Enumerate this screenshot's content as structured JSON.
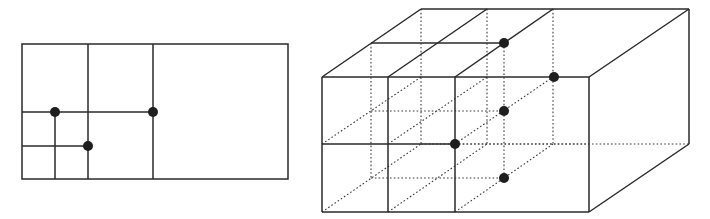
{
  "figure": {
    "colors": {
      "line": "#2a2a2a",
      "dot": "#1e1e1e",
      "background": "#ffffff"
    }
  },
  "quadtree_2d": {
    "frame": {
      "x1": 22,
      "y1": 44,
      "x2": 288,
      "y2": 179
    },
    "lines": [
      {
        "x1": 88,
        "y1": 44,
        "x2": 88,
        "y2": 179
      },
      {
        "x1": 153,
        "y1": 44,
        "x2": 153,
        "y2": 179
      },
      {
        "x1": 22,
        "y1": 112,
        "x2": 153,
        "y2": 112
      },
      {
        "x1": 22,
        "y1": 146,
        "x2": 88,
        "y2": 146
      },
      {
        "x1": 55,
        "y1": 112,
        "x2": 55,
        "y2": 179
      }
    ],
    "points": [
      {
        "x": 55,
        "y": 112
      },
      {
        "x": 153,
        "y": 112
      },
      {
        "x": 88,
        "y": 146
      }
    ]
  },
  "octree_3d": {
    "solid_lines": [
      [
        322,
        77,
        589,
        77
      ],
      [
        589,
        77,
        589,
        212
      ],
      [
        589,
        212,
        322,
        212
      ],
      [
        322,
        212,
        322,
        77
      ],
      [
        322,
        77,
        421,
        9
      ],
      [
        421,
        9,
        689,
        9
      ],
      [
        689,
        9,
        689,
        144
      ],
      [
        589,
        77,
        689,
        9
      ],
      [
        589,
        212,
        689,
        144
      ],
      [
        388,
        77,
        388,
        212
      ],
      [
        455,
        77,
        455,
        212
      ],
      [
        322,
        144,
        455,
        144
      ],
      [
        388,
        77,
        487,
        9
      ],
      [
        455,
        77,
        553,
        9
      ],
      [
        371,
        43,
        504,
        43
      ]
    ],
    "dotted_lines": [
      [
        421,
        9,
        421,
        144
      ],
      [
        421,
        144,
        689,
        144
      ],
      [
        322,
        212,
        421,
        144
      ],
      [
        487,
        9,
        487,
        144
      ],
      [
        553,
        9,
        553,
        144
      ],
      [
        371,
        43,
        371,
        178
      ],
      [
        504,
        43,
        504,
        178
      ],
      [
        371,
        111,
        504,
        111
      ],
      [
        371,
        178,
        504,
        178
      ],
      [
        388,
        212,
        487,
        144
      ],
      [
        455,
        212,
        553,
        144
      ],
      [
        322,
        144,
        421,
        77
      ],
      [
        388,
        144,
        487,
        77
      ],
      [
        455,
        144,
        553,
        77
      ],
      [
        455,
        144,
        589,
        144
      ]
    ],
    "points": [
      {
        "x": 504,
        "y": 43
      },
      {
        "x": 554,
        "y": 77
      },
      {
        "x": 504,
        "y": 111
      },
      {
        "x": 455,
        "y": 144
      },
      {
        "x": 504,
        "y": 178
      }
    ]
  }
}
